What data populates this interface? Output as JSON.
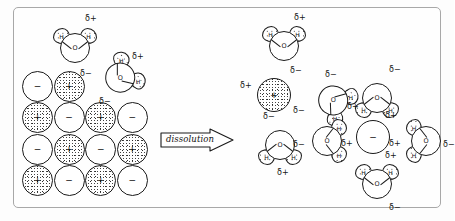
{
  "figure": {
    "process_label": "dissolution",
    "delta_positive": "δ+",
    "delta_negative": "δ−",
    "oxygen_label": "O",
    "hydrogen_label": "H",
    "cation_sign": "+",
    "anion_sign": "−",
    "border_color": "#a8a8a8",
    "ink_color": "#1a1a1a",
    "background": "#fefefe"
  },
  "free_water": [
    {
      "id": "w-free-1",
      "x": 38,
      "y": 16,
      "rot": 0,
      "dplus": "δ+",
      "dminus": "δ−"
    },
    {
      "id": "w-free-2",
      "x": 84,
      "y": 46,
      "rot": 52,
      "dplus": "δ+",
      "dminus": "δ−"
    }
  ],
  "lattice": {
    "label": "ionic crystal lattice",
    "rows": [
      {
        "cells": [
          {
            "charge": "−"
          },
          {
            "charge": "+"
          }
        ]
      },
      {
        "cells": [
          {
            "charge": "+"
          },
          {
            "charge": "−"
          },
          {
            "charge": "+"
          },
          {
            "charge": "−"
          }
        ]
      },
      {
        "cells": [
          {
            "charge": "−"
          },
          {
            "charge": "+"
          },
          {
            "charge": "−"
          },
          {
            "charge": "+"
          }
        ]
      },
      {
        "cells": [
          {
            "charge": "+"
          },
          {
            "charge": "−"
          },
          {
            "charge": "+"
          },
          {
            "charge": "−"
          }
        ]
      }
    ]
  },
  "hydrated_cation": {
    "label": "hydrated cation",
    "ion_sign": "+",
    "waters": [
      {
        "id": "cat-w-top",
        "x": 247,
        "y": 14,
        "rot": 0,
        "dplus": "δ+",
        "dminus": "δ−"
      },
      {
        "id": "cat-w-right",
        "x": 297,
        "y": 70,
        "rot": 126,
        "dplus": "δ+",
        "dminus": "δ−"
      },
      {
        "id": "cat-w-bot",
        "x": 243,
        "y": 115,
        "rot": 180,
        "dplus": "δ+",
        "dminus": "δ−"
      }
    ]
  },
  "hydrated_anion": {
    "label": "hydrated anion",
    "ion_sign": "−",
    "waters": [
      {
        "id": "an-w-top",
        "x": 340,
        "y": 68,
        "rot": 180,
        "dplus": "δ+",
        "dminus": "δ−"
      },
      {
        "id": "an-w-left",
        "x": 291,
        "y": 110,
        "rot": 90,
        "dplus": "δ+",
        "dminus": "δ−"
      },
      {
        "id": "an-w-right",
        "x": 388,
        "y": 110,
        "rot": 270,
        "dplus": "δ+",
        "dminus": "δ−"
      },
      {
        "id": "an-w-bot",
        "x": 340,
        "y": 152,
        "rot": 0,
        "dplus": "δ+",
        "dminus": "δ−"
      }
    ]
  },
  "annotations": [
    {
      "id": "ann-1",
      "text": "δ+",
      "x": 71,
      "y": 6
    },
    {
      "id": "ann-2",
      "text": "δ−",
      "x": 66,
      "y": 61
    },
    {
      "id": "ann-3",
      "text": "δ+",
      "x": 118,
      "y": 44
    },
    {
      "id": "ann-4",
      "text": "δ−",
      "x": 85,
      "y": 89
    },
    {
      "id": "ann-5",
      "text": "δ+",
      "x": 280,
      "y": 5
    },
    {
      "id": "ann-6",
      "text": "δ−",
      "x": 276,
      "y": 58
    },
    {
      "id": "ann-7",
      "text": "δ+",
      "x": 226,
      "y": 73
    },
    {
      "id": "ann-8",
      "text": "δ−",
      "x": 311,
      "y": 62
    },
    {
      "id": "ann-9",
      "text": "δ+",
      "x": 333,
      "y": 94
    },
    {
      "id": "ann-10",
      "text": "δ−",
      "x": 279,
      "y": 98
    },
    {
      "id": "ann-11",
      "text": "δ−",
      "x": 249,
      "y": 104
    },
    {
      "id": "ann-12",
      "text": "δ+",
      "x": 263,
      "y": 160
    },
    {
      "id": "ann-13",
      "text": "δ−",
      "x": 375,
      "y": 57
    },
    {
      "id": "ann-14",
      "text": "δ+",
      "x": 371,
      "y": 103
    },
    {
      "id": "ann-15",
      "text": "δ−",
      "x": 279,
      "y": 132
    },
    {
      "id": "ann-16",
      "text": "δ+",
      "x": 327,
      "y": 131
    },
    {
      "id": "ann-17",
      "text": "δ+",
      "x": 375,
      "y": 131
    },
    {
      "id": "ann-18",
      "text": "δ−",
      "x": 429,
      "y": 132
    },
    {
      "id": "ann-19",
      "text": "δ+",
      "x": 371,
      "y": 143
    },
    {
      "id": "ann-20",
      "text": "δ−",
      "x": 375,
      "y": 195
    }
  ]
}
